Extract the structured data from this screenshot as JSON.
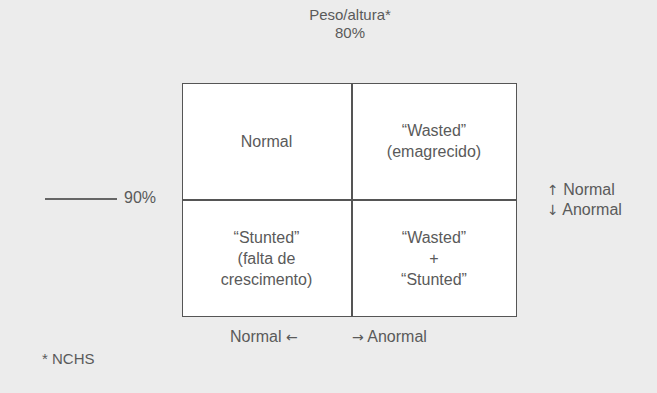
{
  "header": {
    "title": "Peso/altura*",
    "threshold_top": "80%"
  },
  "left_axis": {
    "threshold": "90%"
  },
  "right_legend": {
    "up_arrow": "↑",
    "up_label": "Normal",
    "down_arrow": "↓",
    "down_label": "Anormal"
  },
  "bottom_axis": {
    "left_label": "Normal",
    "left_arrow": "←",
    "right_arrow": "→",
    "right_label": "Anormal"
  },
  "cells": {
    "top_left": {
      "line1": "Normal"
    },
    "top_right": {
      "line1": "“Wasted”",
      "line2": "(emagrecido)"
    },
    "bottom_left": {
      "line1": "“Stunted”",
      "line2": "(falta de",
      "line3": "crescimento)"
    },
    "bottom_right": {
      "line1": "“Wasted”",
      "line2": "+",
      "line3": "“Stunted”"
    }
  },
  "footnote": "* NCHS",
  "colors": {
    "background": "#ececec",
    "cell_background": "#ffffff",
    "line": "#555555",
    "text": "#5a5a5a"
  }
}
